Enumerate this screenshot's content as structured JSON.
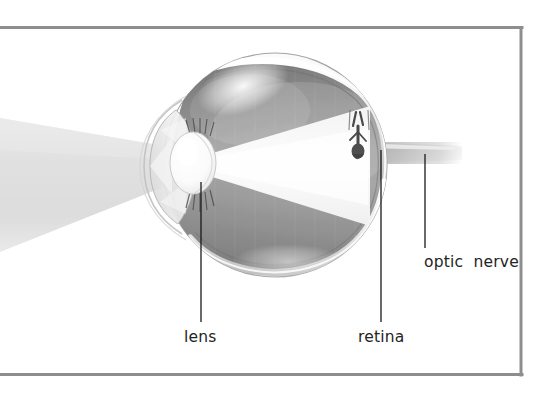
{
  "figure": {
    "frame": {
      "color": "#8e8e8e",
      "thickness_px": 3,
      "left": 0,
      "top": 26,
      "right": 522,
      "bottom": 375,
      "open_side": "left"
    },
    "background_color": "#ffffff"
  },
  "labels": [
    {
      "id": "lens",
      "text": "lens",
      "x": 184,
      "y": 330,
      "leader": {
        "x1": 201,
        "y1": 182,
        "x2": 201,
        "y2": 322
      }
    },
    {
      "id": "retina",
      "text": "retina",
      "x": 358,
      "y": 330,
      "leader": {
        "x1": 381,
        "y1": 150,
        "x2": 381,
        "y2": 322
      }
    },
    {
      "id": "optic_nerve",
      "text": "optic  nerve",
      "x": 424,
      "y": 255,
      "leader": {
        "x1": 425,
        "y1": 154,
        "x2": 425,
        "y2": 248
      }
    }
  ],
  "anatomy": {
    "eyeball": {
      "name": "sclera",
      "center_x": 275,
      "center_y": 165,
      "radius": 112,
      "fill_light": "#ffffff",
      "fill_shadow": "#d2d2d2",
      "outline": "#9a9a9a"
    },
    "interior": {
      "name": "choroid-retina",
      "fill_dark": "#6f6f6f",
      "fill_mid": "#9a9a9a",
      "fill_light": "#c8c8c8"
    },
    "lens": {
      "name": "lens",
      "center_x": 193,
      "center_y": 163,
      "rx": 22,
      "ry": 30,
      "fill": "#fbfbfb"
    },
    "cornea": {
      "name": "cornea",
      "fill": "#eeeeee",
      "opacity": 0.75
    },
    "light_cone": {
      "name": "light-beam",
      "color": "#e2e2e2",
      "color_highlight": "#f2f2f2",
      "enters_from": "left"
    },
    "optic_nerve_band": {
      "name": "optic-nerve",
      "color": "#bfbfbf",
      "y_top": 142,
      "y_bottom": 162,
      "x_start": 372,
      "x_end": 460
    },
    "retinal_image": {
      "name": "inverted-image",
      "description": "inverted figure projected on retina",
      "color": "#555555"
    }
  },
  "colors": {
    "frame": "#8e8e8e",
    "text": "#242424",
    "leader_line": "#1a1a1a",
    "beam": "#e2e2e2",
    "interior_dark": "#6f6f6f",
    "sclera": "#ffffff"
  }
}
